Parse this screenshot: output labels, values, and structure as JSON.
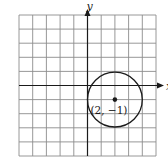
{
  "figure": {
    "type": "coordinate-plane-circle",
    "grid": {
      "cols": 10,
      "rows": 10,
      "x_min": -5,
      "x_max": 5,
      "y_min": -5,
      "y_max": 5
    },
    "axes": {
      "x_label": "x",
      "y_label": "y"
    },
    "circle": {
      "center": [
        2,
        -1
      ],
      "radius": 2
    },
    "center_point": {
      "label": "(2, −1)"
    },
    "colors": {
      "grid": "#8c8c8c",
      "axis": "#1a1a1a",
      "circle": "#1a1a1a",
      "background": "#ffffff"
    }
  }
}
